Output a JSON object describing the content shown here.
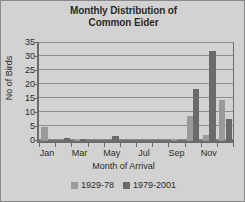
{
  "chart_data": {
    "type": "bar",
    "title": "Monthly Distribution of Common Eider",
    "title_line1": "Monthly Distribution of",
    "title_line2": "Common Eider",
    "xlabel": "Month of Arrival",
    "ylabel": "No of Birds",
    "ylim": [
      0,
      35
    ],
    "yticks": [
      0,
      5,
      10,
      15,
      20,
      25,
      30,
      35
    ],
    "grid": true,
    "legend_position": "bottom",
    "categories": [
      "Jan",
      "Feb",
      "Mar",
      "Apr",
      "May",
      "Jun",
      "Jul",
      "Aug",
      "Sep",
      "Oct",
      "Nov",
      "Dec"
    ],
    "tick_labels_shown": [
      "Jan",
      "Mar",
      "May",
      "Jul",
      "Sep",
      "Nov"
    ],
    "series": [
      {
        "name": "1929-78",
        "color": "#9a9a9a",
        "values": [
          5,
          0,
          0.7,
          0,
          0,
          0,
          0,
          0,
          0.8,
          8.8,
          2,
          14.8
        ]
      },
      {
        "name": "1979-2001",
        "color": "#6a6a6a",
        "values": [
          0,
          1.2,
          0.7,
          0,
          1.9,
          0,
          0,
          0,
          0,
          18.7,
          32,
          7.7
        ]
      }
    ]
  },
  "colors": {
    "background": "#d2d2d2",
    "border": "#8a8a8a",
    "axis": "#6b6b6b",
    "gridline": "#8d8d8d",
    "series1": "#9a9a9a",
    "series2": "#6a6a6a"
  }
}
